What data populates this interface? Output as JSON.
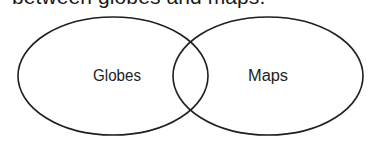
{
  "caption": "between globes and maps.",
  "diagram": {
    "type": "venn",
    "sets": [
      {
        "label": "Globes",
        "cx": 113,
        "cy": 76,
        "rx": 95,
        "ry": 59
      },
      {
        "label": "Maps",
        "cx": 268,
        "cy": 76,
        "rx": 95,
        "ry": 59
      }
    ],
    "stroke_color": "#1e1e1e",
    "background": "#ffffff"
  }
}
